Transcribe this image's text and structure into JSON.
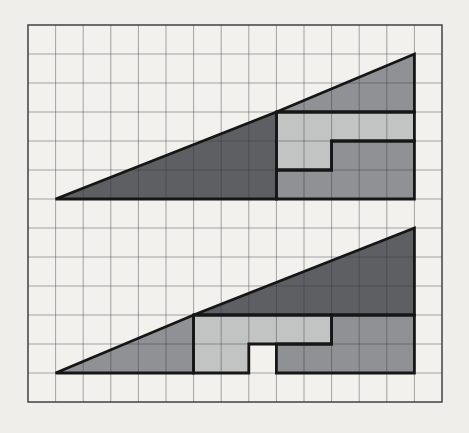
{
  "canvas": {
    "width": 469,
    "height": 433,
    "background": "#efeeeb"
  },
  "grid": {
    "cols": 15,
    "rows": 13,
    "left": 28,
    "top": 25,
    "cell_width": 27.6,
    "cell_height": 29.0,
    "paper_color": "#f2f1ee",
    "line_color": "rgba(55,55,60,0.42)",
    "border_color": "rgba(45,45,50,0.75)"
  },
  "palette": {
    "dark": "#5d5f62",
    "medium": "#8f9194",
    "light": "#c2c4c3",
    "outline": "#161616"
  },
  "figures": [
    {
      "name": "assembled-triangle-13x5",
      "origin": {
        "col": 1,
        "row": 6
      },
      "width_units": 13,
      "height_units": 5,
      "pieces": [
        {
          "name": "large-dark-triangle-8x3",
          "color": "dark",
          "points": [
            [
              0,
              0
            ],
            [
              8,
              0
            ],
            [
              8,
              3
            ]
          ]
        },
        {
          "name": "small-medium-triangle-5x2",
          "color": "medium",
          "points": [
            [
              8,
              3
            ],
            [
              13,
              3
            ],
            [
              13,
              5
            ]
          ]
        },
        {
          "name": "light-l-piece-7-cells",
          "color": "light",
          "points": [
            [
              8,
              1
            ],
            [
              10,
              1
            ],
            [
              10,
              2
            ],
            [
              13,
              2
            ],
            [
              13,
              3
            ],
            [
              8,
              3
            ]
          ]
        },
        {
          "name": "medium-l-piece-8-cells",
          "color": "medium",
          "points": [
            [
              8,
              0
            ],
            [
              13,
              0
            ],
            [
              13,
              2
            ],
            [
              10,
              2
            ],
            [
              10,
              1
            ],
            [
              8,
              1
            ]
          ]
        }
      ]
    },
    {
      "name": "rearranged-triangle-with-missing-square",
      "origin": {
        "col": 1,
        "row": 12
      },
      "width_units": 13,
      "height_units": 5,
      "pieces": [
        {
          "name": "small-medium-triangle-5x2",
          "color": "medium",
          "points": [
            [
              0,
              0
            ],
            [
              5,
              0
            ],
            [
              5,
              2
            ]
          ]
        },
        {
          "name": "large-dark-triangle-8x3",
          "color": "dark",
          "points": [
            [
              5,
              2
            ],
            [
              13,
              2
            ],
            [
              13,
              5
            ]
          ]
        },
        {
          "name": "light-l-piece-7-cells",
          "color": "light",
          "points": [
            [
              5,
              0
            ],
            [
              7,
              0
            ],
            [
              7,
              1
            ],
            [
              10,
              1
            ],
            [
              10,
              2
            ],
            [
              5,
              2
            ]
          ]
        },
        {
          "name": "medium-l-piece-8-cells",
          "color": "medium",
          "points": [
            [
              8,
              0
            ],
            [
              13,
              0
            ],
            [
              13,
              2
            ],
            [
              10,
              2
            ],
            [
              10,
              1
            ],
            [
              8,
              1
            ]
          ]
        }
      ],
      "hole": {
        "name": "missing-square",
        "x": 7,
        "y": 0,
        "w": 1,
        "h": 1,
        "open_bottom": true
      }
    }
  ]
}
